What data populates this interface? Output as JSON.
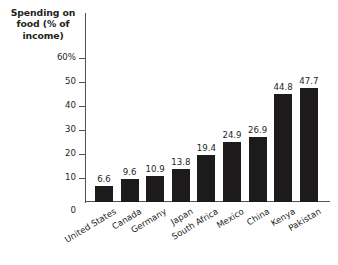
{
  "chart_data": {
    "type": "bar",
    "title": "Spending on food (% of income)",
    "title_lines": [
      "Spending on",
      "food (% of",
      "income)"
    ],
    "xlabel": "",
    "ylabel": "",
    "ylim": [
      0,
      60
    ],
    "grid": false,
    "legend": null,
    "y_ticks": [
      {
        "value": 60,
        "label": "60%"
      },
      {
        "value": 50,
        "label": "50"
      },
      {
        "value": 40,
        "label": "40"
      },
      {
        "value": 30,
        "label": "30"
      },
      {
        "value": 20,
        "label": "20"
      },
      {
        "value": 10,
        "label": "10"
      },
      {
        "value": 0,
        "label": "0"
      }
    ],
    "categories": [
      "United States",
      "Canada",
      "Germany",
      "Japan",
      "South Africa",
      "Mexico",
      "China",
      "Kenya",
      "Pakistan"
    ],
    "values": [
      6.6,
      9.6,
      10.9,
      13.8,
      19.4,
      24.9,
      26.9,
      44.8,
      47.7
    ],
    "value_labels": [
      "6.6",
      "9.6",
      "10.9",
      "13.8",
      "19.4",
      "24.9",
      "26.9",
      "44.8",
      "47.7"
    ],
    "bar_color": "#1c1a1b",
    "axis_color": "#555154",
    "text_color": "#231f20",
    "background": "#ffffff"
  }
}
